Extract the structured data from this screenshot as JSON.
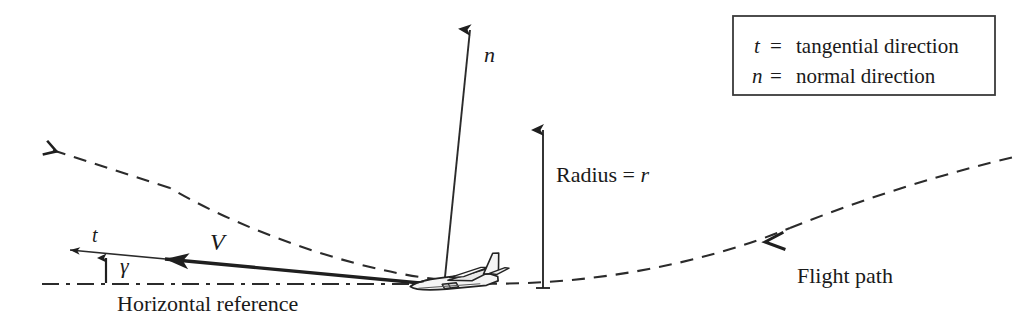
{
  "figure": {
    "background_color": "#ffffff",
    "line_color": "#2b2b2b",
    "text_color": "#1a1a1a"
  },
  "labels": {
    "normal_vector": "n",
    "tangential_vector": "t",
    "velocity_vector": "V",
    "flight_path_angle": "γ",
    "radius": "Radius = r",
    "radius_symbol": "r",
    "horizontal_reference": "Horizontal reference",
    "flight_path": "Flight path"
  },
  "legend": {
    "rows": [
      {
        "symbol": "t",
        "equals": "=",
        "description": "tangential direction"
      },
      {
        "symbol": "n",
        "equals": "=",
        "description": "normal direction"
      }
    ]
  },
  "geometry": {
    "aircraft_position": {
      "x": 462,
      "y": 281
    },
    "flight_path_curve": "dashed arc from upper-left through aircraft to upper-right",
    "horizontal_reference_style": "dash-dot",
    "radius_line": {
      "x": 543,
      "from_y": 287,
      "to_y": 124
    },
    "normal_arrow": {
      "from": {
        "x": 445,
        "y": 277
      },
      "to": {
        "x": 470,
        "y": 22
      }
    },
    "tangential_arrow": {
      "from": {
        "x": 200,
        "y": 262
      },
      "to": {
        "x": 62,
        "y": 249
      }
    },
    "velocity_arrow": {
      "from": {
        "x": 455,
        "y": 286
      },
      "to": {
        "x": 152,
        "y": 258
      }
    }
  }
}
